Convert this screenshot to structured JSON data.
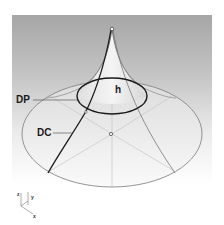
{
  "figure": {
    "labels": {
      "apex_height": "h",
      "ring": "DP",
      "curve": "DC"
    },
    "axes": {
      "z": "z",
      "y": "y",
      "x": "x"
    },
    "colors": {
      "background_top": "#a8a8a8",
      "background_bottom": "#ffffff",
      "surface": "#f2f2f2",
      "edge": "#777777",
      "bold_line": "#1a1a1a",
      "guide_line": "#bbbbbb"
    }
  }
}
